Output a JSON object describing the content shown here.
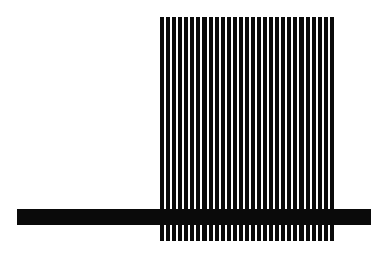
{
  "figure": {
    "background": "#ffffff",
    "foreground": "#0a0a0a",
    "stripes": {
      "count": 29,
      "orientation": "vertical",
      "left": 160,
      "top": 17,
      "width": 174,
      "height": 224,
      "gap": 2
    },
    "bar": {
      "orientation": "horizontal",
      "left": 17,
      "top": 209,
      "width": 354,
      "height": 16
    }
  }
}
